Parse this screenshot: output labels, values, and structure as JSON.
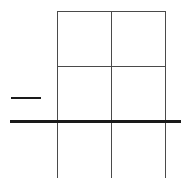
{
  "diagram": {
    "type": "grid-sketch",
    "background": "#ffffff",
    "grid": {
      "columns": 2,
      "rows_visible": 3,
      "left": 57,
      "top": 11,
      "right": 166,
      "bottom": 178,
      "col_dividers_x": [
        57,
        111,
        165
      ],
      "row_dividers_y": [
        11,
        66
      ],
      "line_color": "#4a4a4a"
    },
    "short_dash": {
      "x1": 11,
      "x2": 41,
      "y": 98,
      "thickness": 2,
      "color": "#1a1a1a"
    },
    "thick_line": {
      "x1": 10,
      "x2": 181,
      "y": 121,
      "thickness": 3,
      "color": "#1a1a1a"
    }
  }
}
